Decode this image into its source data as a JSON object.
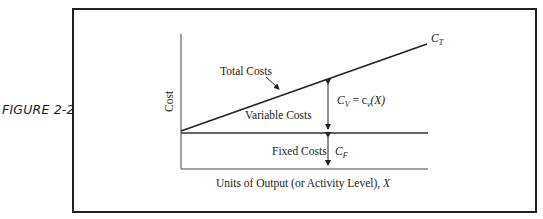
{
  "figure": {
    "label": "FIGURE 2-2"
  },
  "diagram": {
    "y_axis_label": "Cost",
    "x_axis_label": "Units of Output (or Activity Level), ",
    "x_axis_var": "X",
    "total_costs_label": "Total Costs",
    "variable_costs_label": "Variable Costs",
    "fixed_costs_label": "Fixed Costs",
    "ct_main": "C",
    "ct_sub": "T",
    "cv_main": "C",
    "cv_sub": "V",
    "cv_eq": " = c",
    "cv_eq_sub": "v",
    "cv_eq_tail": "(X)",
    "cf_main": "C",
    "cf_sub": "F"
  }
}
